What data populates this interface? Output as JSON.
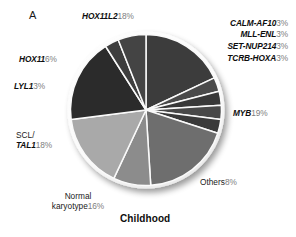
{
  "figure": {
    "panel_letter": "A",
    "title": "Childhood",
    "background_color": "#ffffff"
  },
  "chart_data": {
    "type": "pie",
    "title": "Childhood",
    "panel": "A",
    "unit": "%",
    "total": 100,
    "start_angle_deg": 0,
    "direction": "clockwise",
    "legend": "none-labels-outside",
    "categories": [
      "HOX11L2",
      "CALM-AF10",
      "MLL-ENL",
      "SET-NUP214",
      "TCRB-HOXA",
      "MYB",
      "Others",
      "Normal karyotype",
      "SCL/TAL1",
      "LYL1",
      "HOX11"
    ],
    "values": [
      18,
      3,
      3,
      3,
      3,
      19,
      8,
      16,
      18,
      3,
      6
    ],
    "colors": [
      "#3c3c3c",
      "#4a4a4a",
      "#383838",
      "#484848",
      "#3a3a3a",
      "#6e6e6e",
      "#8c8c8c",
      "#a9a9a9",
      "#2b2b2b",
      "#3e3e3e",
      "#444444"
    ],
    "slices": [
      {
        "label": "HOX11L2",
        "value": 18,
        "italic": true,
        "color": "#3c3c3c"
      },
      {
        "label": "CALM-AF10",
        "value": 3,
        "italic": true,
        "color": "#4a4a4a"
      },
      {
        "label": "MLL-ENL",
        "value": 3,
        "italic": true,
        "color": "#383838"
      },
      {
        "label": "SET-NUP214",
        "value": 3,
        "italic": true,
        "color": "#484848"
      },
      {
        "label": "TCRB-HOXA",
        "value": 3,
        "italic": true,
        "color": "#3a3a3a"
      },
      {
        "label": "MYB",
        "value": 19,
        "italic": true,
        "color": "#6e6e6e"
      },
      {
        "label": "Others",
        "value": 8,
        "italic": false,
        "color": "#8c8c8c"
      },
      {
        "label": "Normal karyotype",
        "value": 16,
        "italic": false,
        "color": "#a9a9a9"
      },
      {
        "label": "SCL/TAL1",
        "value": 18,
        "italic": true,
        "color": "#2b2b2b"
      },
      {
        "label": "LYL1",
        "value": 3,
        "italic": true,
        "color": "#3e3e3e"
      },
      {
        "label": "HOX11",
        "value": 6,
        "italic": true,
        "color": "#444444"
      }
    ]
  },
  "labels": {
    "hox11l2": {
      "gene": "HOX11L2",
      "pct": "18%"
    },
    "calm_af10": {
      "gene": "CALM-AF10",
      "pct": "3%"
    },
    "mll_enl": {
      "gene": "MLL-ENL",
      "pct": "3%"
    },
    "set_nup214": {
      "gene": "SET-NUP214",
      "pct": "3%"
    },
    "tcrb_hoxa": {
      "gene": "TCRB-HOXA",
      "pct": "3%"
    },
    "myb": {
      "gene": "MYB",
      "pct": "19%"
    },
    "others": {
      "gene": "Others",
      "pct": "8%"
    },
    "normal_kar": {
      "line1": "Normal",
      "gene": "karyotype",
      "pct": "16%"
    },
    "scl_tal1": {
      "line1": "SCL/",
      "gene": "TAL1",
      "pct": "18%"
    },
    "lyl1": {
      "gene": "LYL1",
      "pct": "3%"
    },
    "hox11": {
      "gene": "HOX11",
      "pct": "6%"
    }
  }
}
